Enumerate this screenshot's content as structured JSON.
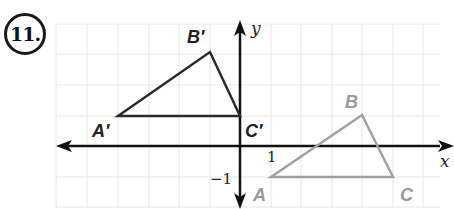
{
  "problem": {
    "number": "11."
  },
  "axes": {
    "x_label": "x",
    "y_label": "y",
    "tick_x": "1",
    "tick_y": "−1"
  },
  "preimage": {
    "color": "#9a9a9a",
    "vertices": [
      {
        "name": "A",
        "x": 1,
        "y": -1
      },
      {
        "name": "B",
        "x": 4,
        "y": 1
      },
      {
        "name": "C",
        "x": 5,
        "y": -1
      }
    ]
  },
  "image": {
    "color": "#2a2a2a",
    "vertices": [
      {
        "name": "A′",
        "x": -4,
        "y": 1
      },
      {
        "name": "B′",
        "x": -1,
        "y": 3
      },
      {
        "name": "C′",
        "x": 0,
        "y": 1
      }
    ]
  },
  "grid": {
    "x_min": -6,
    "x_max": 6,
    "y_min": -2,
    "y_max": 4,
    "unit_px": 30.5,
    "color": "#e4e4e4"
  }
}
